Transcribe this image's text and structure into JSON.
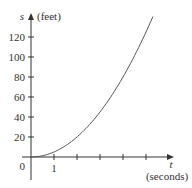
{
  "chart_data": {
    "type": "line",
    "title": "",
    "function": "s = 5t^2",
    "xlabel_symbol": "t",
    "xlabel_unit": "(seconds)",
    "ylabel_symbol": "s",
    "ylabel_unit": "(feet)",
    "origin_label": "0",
    "x_tick_labels": [
      "1"
    ],
    "x_ticks": [
      1,
      2,
      3,
      4,
      5
    ],
    "y_ticks": [
      20,
      40,
      60,
      80,
      100,
      120
    ],
    "y_tick_labels": [
      "20",
      "40",
      "60",
      "80",
      "100",
      "120"
    ],
    "xlim": [
      0,
      5.3
    ],
    "ylim": [
      0,
      140
    ],
    "series": [
      {
        "name": "s(t)",
        "x": [
          0,
          0.5,
          1,
          1.5,
          2,
          2.5,
          3,
          3.5,
          4,
          4.5,
          5,
          5.26
        ],
        "values": [
          0,
          1.25,
          5,
          11.25,
          20,
          31.25,
          45,
          61.25,
          80,
          101.25,
          125,
          138.3
        ]
      }
    ],
    "grid": false,
    "legend": "none",
    "colors": {
      "curve": "#555555",
      "axes": "#333333"
    }
  }
}
